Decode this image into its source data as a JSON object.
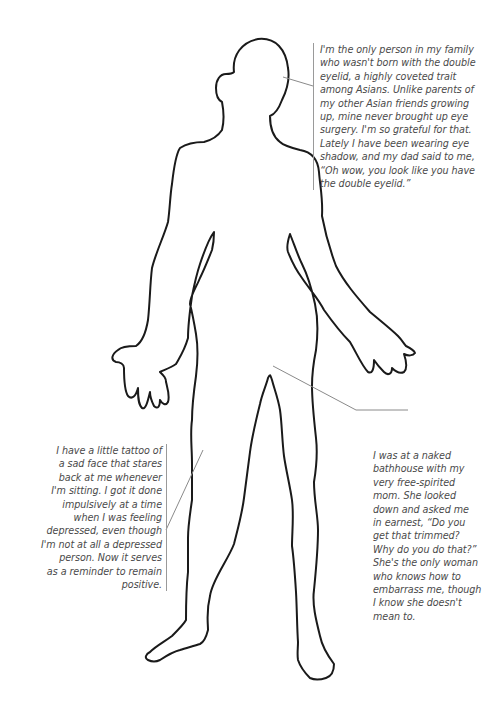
{
  "figure": {
    "outline_color": "#1a1a1a",
    "leader_color": "#8a8a8a",
    "text_color": "#4a4a4a"
  },
  "annotations": [
    {
      "id": "eyelid",
      "target": "head",
      "lines": [
        "I'm the only person in my family",
        "who wasn't born with the double",
        "eyelid, a highly coveted trait",
        "among Asians. Unlike parents of",
        "my other Asian friends growing",
        "up, mine never brought up eye",
        "surgery. I'm so grateful for that.",
        "Lately I have been wearing eye",
        "shadow, and my dad said to me,",
        "“Oh wow, you look like you have",
        "the double eyelid.”"
      ]
    },
    {
      "id": "tattoo",
      "target": "right-thigh",
      "lines": [
        "I have a little tattoo of",
        "a sad face that stares",
        "back at me whenever",
        "I'm sitting. I got it done",
        "impulsively at a time",
        "when I was feeling",
        "depressed, even though",
        "I'm not at all a depressed",
        "person. Now it serves",
        "as a reminder to remain",
        "positive."
      ]
    },
    {
      "id": "bathhouse",
      "target": "groin",
      "lines": [
        "I was at a naked",
        "bathhouse with my",
        "very free-spirited",
        "mom. She looked",
        "down and asked me",
        "in earnest, “Do you",
        "get that trimmed?",
        "Why do you do that?”",
        "She's the only woman",
        "who knows how to",
        "embarrass me, though",
        "I know she doesn't",
        "mean to."
      ]
    }
  ]
}
